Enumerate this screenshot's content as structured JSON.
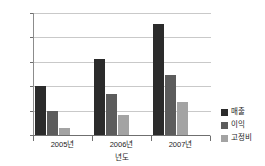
{
  "chart_data": {
    "type": "bar",
    "title": "",
    "xlabel": "년도",
    "ylabel": "",
    "ylim": [
      0,
      2500
    ],
    "yticks": [
      0,
      500,
      1000,
      1500,
      2000,
      2500
    ],
    "ytick_labels": [
      "0",
      "500",
      "1000",
      "1500",
      "2000",
      "2500"
    ],
    "categories": [
      "2005년",
      "2006년",
      "2007년"
    ],
    "grid": "horizontal",
    "legend_position": "right",
    "series": [
      {
        "name": "매출",
        "color": "#2b2b2b",
        "values": [
          1000,
          1550,
          2270
        ]
      },
      {
        "name": "이익",
        "color": "#5c5c5c",
        "values": [
          490,
          840,
          1240
        ]
      },
      {
        "name": "고정비",
        "color": "#a3a3a3",
        "values": [
          140,
          420,
          680
        ]
      }
    ]
  }
}
